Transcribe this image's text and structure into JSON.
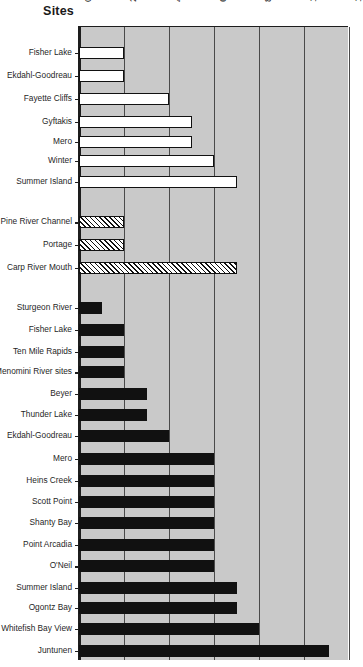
{
  "axis_title": "Sites",
  "chart_data": {
    "type": "bar",
    "orientation": "horizontal",
    "title": "Sites",
    "xlabel": "",
    "ylabel": "Sites",
    "xlim": [
      0,
      12
    ],
    "xticks": [
      0,
      2,
      4,
      6,
      8,
      10,
      12
    ],
    "xtick_labels": [
      "0",
      "2",
      "4",
      "6",
      "8",
      "10",
      "12"
    ],
    "grid": true,
    "legend": false,
    "plot_background": "#c9c9c9",
    "bar_styles": {
      "open": "white fill, black outline",
      "hatch": "diagonal hatched fill, black outline",
      "solid": "solid black fill"
    },
    "groups": [
      {
        "style": "open",
        "categories": [
          "Fisher Lake",
          "Ekdahl-Goodreau",
          "Fayette Cliffs",
          "Gyftakis",
          "Mero",
          "Winter",
          "Summer Island"
        ],
        "values": [
          2,
          2,
          4,
          5,
          5,
          6,
          7
        ]
      },
      {
        "style": "hatch",
        "categories": [
          "Pine River Channel",
          "Portage",
          "Carp River Mouth"
        ],
        "values": [
          2,
          2,
          7
        ]
      },
      {
        "style": "solid",
        "categories": [
          "Sturgeon River",
          "Fisher Lake",
          "Ten Mile Rapids",
          "Menomini River sites",
          "Beyer",
          "Thunder Lake",
          "Ekdahl-Goodreau",
          "Mero",
          "Heins Creek",
          "Scott Point",
          "Shanty Bay",
          "Point Arcadia",
          "O'Neil",
          "Summer Island",
          "Ogontz Bay",
          "Whitefish Bay View",
          "Juntunen"
        ],
        "values": [
          1,
          2,
          2,
          2,
          3,
          3,
          4,
          6,
          6,
          6,
          6,
          6,
          6,
          7,
          7,
          8,
          11.1
        ]
      }
    ]
  },
  "rows": [
    {
      "label": "Fisher Lake",
      "value": 2,
      "style": "open",
      "y": 22
    },
    {
      "label": "Ekdahl-Goodreau",
      "value": 2,
      "style": "open",
      "y": 47
    },
    {
      "label": "Fayette Cliffs",
      "value": 4,
      "style": "open",
      "y": 72
    },
    {
      "label": "Gyftakis",
      "value": 5,
      "style": "open",
      "y": 97
    },
    {
      "label": "Mero",
      "value": 5,
      "style": "open",
      "y": 118
    },
    {
      "label": "Winter",
      "value": 6,
      "style": "open",
      "y": 139
    },
    {
      "label": "Summer Island",
      "value": 7,
      "style": "open",
      "y": 162
    },
    {
      "label": "Pine River Channel",
      "value": 2,
      "style": "hatch",
      "y": 206
    },
    {
      "label": "Portage",
      "value": 2,
      "style": "hatch",
      "y": 230
    },
    {
      "label": "Carp River Mouth",
      "value": 7,
      "style": "hatch",
      "y": 255
    },
    {
      "label": "Sturgeon River",
      "value": 1,
      "style": "solid",
      "y": 299
    },
    {
      "label": "Fisher Lake",
      "value": 2,
      "style": "solid",
      "y": 323
    },
    {
      "label": "Ten Mile Rapids",
      "value": 2,
      "style": "solid",
      "y": 347
    },
    {
      "label": "Menomini River sites",
      "value": 2,
      "style": "solid",
      "y": 369
    },
    {
      "label": "Beyer",
      "value": 3,
      "style": "solid",
      "y": 392
    },
    {
      "label": "Thunder Lake",
      "value": 3,
      "style": "solid",
      "y": 415
    },
    {
      "label": "Ekdahl-Goodreau",
      "value": 4,
      "style": "solid",
      "y": 438
    },
    {
      "label": "Mero",
      "value": 6,
      "style": "solid",
      "y": 463
    },
    {
      "label": "Heins Creek",
      "value": 6,
      "style": "solid",
      "y": 487
    },
    {
      "label": "Scott Point",
      "value": 6,
      "style": "solid",
      "y": 510
    },
    {
      "label": "Shanty Bay",
      "value": 6,
      "style": "solid",
      "y": 533
    },
    {
      "label": "Point Arcadia",
      "value": 6,
      "style": "solid",
      "y": 557
    },
    {
      "label": "O'Neil",
      "value": 6,
      "style": "solid",
      "y": 580
    },
    {
      "label": "Summer Island",
      "value": 7,
      "style": "solid",
      "y": 603
    },
    {
      "label": "Ogontz Bay",
      "value": 7,
      "style": "solid",
      "y": 625
    },
    {
      "label": "Whitefish Bay View",
      "value": 8,
      "style": "solid",
      "y": 648
    },
    {
      "label": "Juntunen",
      "value": 11.1,
      "style": "solid",
      "y": 672
    }
  ]
}
